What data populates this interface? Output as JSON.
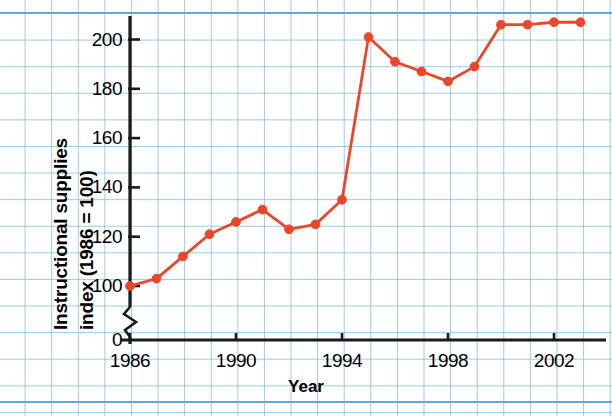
{
  "chart_data": {
    "type": "line",
    "title": "",
    "xlabel": "Year",
    "ylabel": "Instructional supplies index (1986 = 100)",
    "ylabel_lines": [
      "Instructional supplies",
      "index (1986 = 100)"
    ],
    "x": [
      1986,
      1987,
      1988,
      1989,
      1990,
      1991,
      1992,
      1993,
      1994,
      1995,
      1996,
      1997,
      1998,
      1999,
      2000,
      2001,
      2002,
      2003
    ],
    "values": [
      100,
      103,
      112,
      121,
      126,
      131,
      123,
      125,
      135,
      201,
      191,
      187,
      183,
      189,
      206,
      206,
      207,
      207
    ],
    "xlim": [
      1985.6,
      2003.6
    ],
    "ylim": [
      95,
      212
    ],
    "y_ticks": [
      100,
      120,
      140,
      160,
      180,
      200
    ],
    "y_tick_labels": [
      "100",
      "120",
      "140",
      "160",
      "180",
      "200"
    ],
    "x_ticks": [
      1986,
      1990,
      1994,
      1998,
      2002
    ],
    "x_tick_labels": [
      "1986",
      "1990",
      "1994",
      "1998",
      "2002"
    ],
    "origin_label": "0",
    "axis_break": true,
    "grid": "graph-paper",
    "legend": null,
    "series_color": "#e8472a",
    "marker": "circle",
    "axis_color": "#1a1a1a",
    "grid_color": "#78b9e1"
  }
}
